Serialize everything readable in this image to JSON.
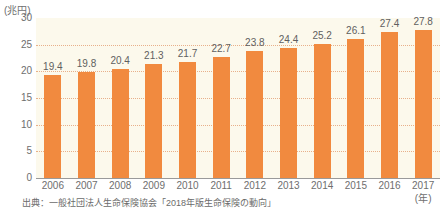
{
  "chart_data": {
    "type": "bar",
    "title": "",
    "subtitle": "",
    "xlabel": "(年)",
    "ylabel": "(兆円)",
    "unit_label": "(兆円)",
    "year_unit_label": "(年)",
    "categories": [
      "2006",
      "2007",
      "2008",
      "2009",
      "2010",
      "2011",
      "2012",
      "2013",
      "2014",
      "2015",
      "2016",
      "2017"
    ],
    "values": [
      19.4,
      19.8,
      20.4,
      21.3,
      21.7,
      22.7,
      23.8,
      24.4,
      25.2,
      26.1,
      27.4,
      27.8
    ],
    "value_labels": [
      "19.4",
      "19.8",
      "20.4",
      "21.3",
      "21.7",
      "22.7",
      "23.8",
      "24.4",
      "25.2",
      "26.1",
      "27.4",
      "27.8"
    ],
    "ylim": [
      0,
      30
    ],
    "yticks": [
      0,
      5,
      10,
      15,
      20,
      25,
      30
    ],
    "ytick_labels": [
      "0",
      "5",
      "10",
      "15",
      "20",
      "25",
      "30"
    ],
    "grid": true,
    "legend": false,
    "bar_color": "#f18a3f",
    "plot_background": "#fcf9ec",
    "gridline_color": "#e8b08a",
    "axis_color": "#9a9a9a",
    "text_color": "#6e6e6e"
  },
  "source": {
    "note": "出典：一般社団法人生命保険協会「2018年版生命保険の動向」"
  }
}
